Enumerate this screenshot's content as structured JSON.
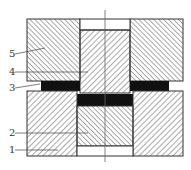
{
  "diagram": {
    "type": "cross-section",
    "colors": {
      "outline": "#333333",
      "hatch": "#555555",
      "workpiece": "#111111",
      "background": "#ffffff"
    },
    "labels": [
      {
        "id": "1",
        "text": "1",
        "x": 9,
        "y": 153,
        "target": [
          40,
          151
        ]
      },
      {
        "id": "2",
        "text": "2",
        "x": 9,
        "y": 136,
        "target": [
          88,
          133
        ]
      },
      {
        "id": "3",
        "text": "3",
        "x": 9,
        "y": 91,
        "target": [
          40,
          85
        ]
      },
      {
        "id": "4",
        "text": "4",
        "x": 9,
        "y": 75,
        "target": [
          88,
          72
        ]
      },
      {
        "id": "5",
        "text": "5",
        "x": 9,
        "y": 57,
        "target": [
          45,
          48
        ]
      }
    ]
  }
}
